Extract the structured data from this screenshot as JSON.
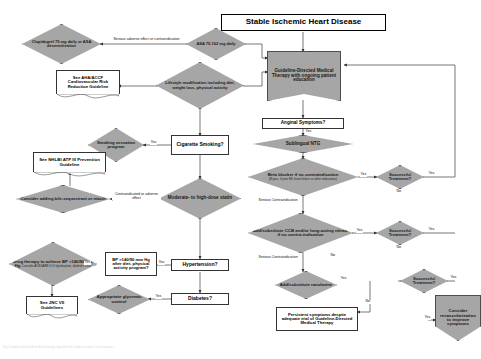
{
  "title": "Stable Ischemic Heart Disease",
  "caption": "Fig. Guideline-directed medical therapy algorithm for stable ischemic heart disease.",
  "colors": {
    "shape_fill": "#a6a6a6",
    "shape_stroke": "#4d4d4d",
    "box_fill": "#ffffff",
    "box_stroke": "#333333",
    "connector": "#555555"
  },
  "nodes": {
    "clopidogrel": "Clopidogrel 75 mg daily or ASA desensitization",
    "asa": "ASA 75-162 mg daily",
    "gdmt": "Guideline-Directed Medical Therapy with ongoing patient education",
    "lifestyle": "Lifestyle modification including diet, weight loss, physical activity",
    "ahaaccf": "See AHA/ACCF Cardiovascular Risk Reduction Guideline",
    "anginal": "Anginal Symptoms?",
    "ntg": "Sublingual NTG",
    "smoking_cessation": "Smoking cessation program",
    "cigarette": "Cigarette Smoking?",
    "betablocker_main": "Beta blocker if no contraindication",
    "betablocker_note": "(Espec. if prior MI, heart failure or other indications)",
    "nhlbi": "See NHLBI ATP III Prevention Guideline",
    "bile": "Consider adding bile-sequestrant or niacin",
    "statin": "Moderate- to high-dose statin",
    "ccb": "Add/substitute CCB and/or long-acting nitrate if no contra-indication",
    "drug_therapy_main": "Drug therapy to achieve BP <140/90 mm Hg",
    "drug_therapy_note": "Consider ACEI/ARB if LV dysfunction, diabetes CKD",
    "bp_check": "BP >140/90 mm Hg after diet, physical activity program?",
    "hypertension": "Hypertension?",
    "ranolazine": "Add/substitute ranolazine",
    "jnc": "See JNC VII Guidelines",
    "glycemic": "Appropriate glycemic control",
    "diabetes": "Diabetes?",
    "persistent": "Persistent symptoms despite adequate trial of Guideline-Directed Medical Therapy",
    "revasc": "Consider revascularization to improve symptoms",
    "successful_1": "Successful Treatment?",
    "successful_2": "Successful Treatment?",
    "successful_3": "Successful Treatment?"
  },
  "edge_labels": {
    "serious_adverse": "Serious adverse effect or contraindication",
    "yes_cigarette": "Yes",
    "contraindicated": "Contraindicated or adverse effect",
    "yes_bp": "Yes",
    "yes_bp2": "Yes",
    "yes_diabetes": "Yes",
    "yes_anginal": "Yes",
    "yes_bb": "Yes",
    "yes_ccb": "Yes",
    "yes_ran": "Yes",
    "yes_succ1": "Yes",
    "yes_succ2": "Yes",
    "yes_succ3": "Yes",
    "no_succ1": "No",
    "no_succ2": "No",
    "no_succ3": "No",
    "no_ccb": "No",
    "serious_contra_1": "Serious Contraindication",
    "serious_contra_2": "Serious Contraindication",
    "yes_revasc": "Yes"
  }
}
